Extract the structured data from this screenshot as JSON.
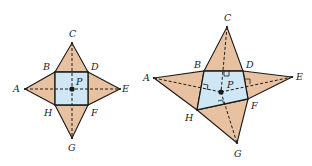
{
  "colors": {
    "triangle_fill": "#e8c2a0",
    "base_fill": "#cfe6f5",
    "stroke": "#1a1a1a"
  },
  "figures": [
    {
      "name": "regular-pyramid-net",
      "labels": {
        "A": "A",
        "B": "B",
        "C": "C",
        "D": "D",
        "E": "E",
        "F": "F",
        "G": "G",
        "H": "H",
        "P": "P"
      }
    },
    {
      "name": "irregular-pyramid-net",
      "labels": {
        "A": "A",
        "B": "B",
        "C": "C",
        "D": "D",
        "E": "E",
        "F": "F",
        "G": "G",
        "H": "H",
        "P": "P"
      }
    }
  ]
}
